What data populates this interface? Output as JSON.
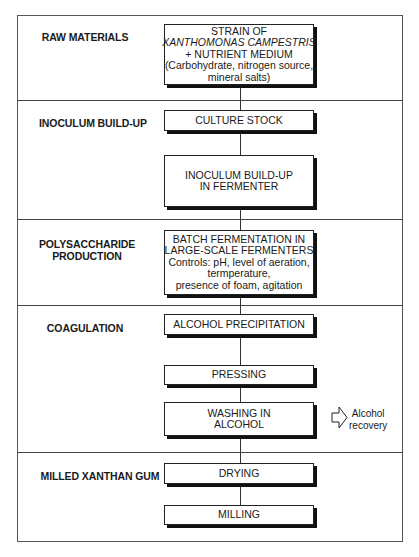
{
  "diagram": {
    "type": "process-flowchart",
    "stages": [
      {
        "label_lines": [
          "RAW MATERIALS"
        ]
      },
      {
        "label_lines": [
          "INOCULUM BUILD-UP"
        ]
      },
      {
        "label_lines": [
          "POLYSACCHARIDE",
          "PRODUCTION"
        ]
      },
      {
        "label_lines": [
          "COAGULATION"
        ]
      },
      {
        "label_lines": [
          "MILLED XANTHAN GUM"
        ]
      }
    ],
    "steps": [
      {
        "lines": [
          "STRAIN OF",
          "XANTHOMONAS CAMPESTRIS",
          "+ NUTRIENT MEDIUM",
          "(Carbohydrate, nitrogen source,",
          "mineral salts)"
        ]
      },
      {
        "lines": [
          "CULTURE STOCK"
        ]
      },
      {
        "lines": [
          "INOCULUM BUILD-UP",
          "IN FERMENTER"
        ]
      },
      {
        "lines": [
          "BATCH FERMENTATION IN",
          "LARGE-SCALE FERMENTERS",
          "Controls: pH, level of aeration,",
          "termperature,",
          "presence of foam, agitation"
        ]
      },
      {
        "lines": [
          "ALCOHOL PRECIPITATION"
        ]
      },
      {
        "lines": [
          "PRESSING"
        ]
      },
      {
        "lines": [
          "WASHING IN",
          "ALCOHOL"
        ]
      },
      {
        "lines": [
          "DRYING"
        ]
      },
      {
        "lines": [
          "MILLING"
        ]
      }
    ],
    "side_output": {
      "icon": "outline-right-arrow-icon",
      "lines": [
        "Alcohol",
        "recovery"
      ]
    }
  }
}
